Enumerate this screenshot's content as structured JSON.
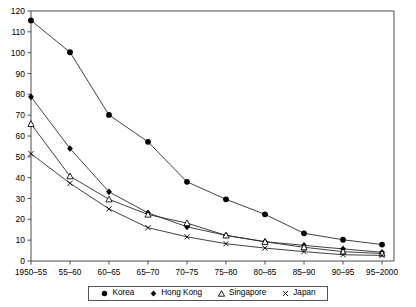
{
  "title_partial": "",
  "chart_data": {
    "type": "line",
    "title": "",
    "xlabel": "",
    "ylabel": "",
    "ylim": [
      0,
      120
    ],
    "ytick_step": 10,
    "grid": false,
    "legend_position": "bottom",
    "yticks": [
      0,
      10,
      20,
      30,
      40,
      50,
      60,
      70,
      80,
      90,
      100,
      110,
      120
    ],
    "categories": [
      "1950–55",
      "55–60",
      "60–65",
      "65–70",
      "70–75",
      "75–80",
      "80–85",
      "85–90",
      "90–95",
      "95–2000"
    ],
    "series": [
      {
        "name": "Korea",
        "marker": "filled-circle",
        "color": "#000000",
        "values": [
          115.5,
          100.2,
          70.1,
          57.2,
          38.0,
          29.6,
          22.4,
          13.3,
          10.2,
          7.9
        ]
      },
      {
        "name": "Hong Kong",
        "marker": "filled-diamond",
        "color": "#000000",
        "values": [
          78.8,
          54.0,
          33.2,
          23.1,
          16.4,
          12.3,
          9.3,
          7.5,
          5.8,
          4.2
        ]
      },
      {
        "name": "Singapore",
        "marker": "open-triangle",
        "color": "#000000",
        "values": [
          65.8,
          40.7,
          29.6,
          22.3,
          18.2,
          12.3,
          9.2,
          6.6,
          4.5,
          3.6
        ]
      },
      {
        "name": "Japan",
        "marker": "cross-x",
        "color": "#000000",
        "values": [
          51.5,
          37.3,
          25.0,
          16.0,
          11.6,
          8.3,
          6.2,
          4.5,
          3.0,
          2.7
        ]
      }
    ]
  },
  "legend": {
    "items": [
      {
        "label": "Korea",
        "marker": "filled-circle"
      },
      {
        "label": "Hong Kong",
        "marker": "filled-diamond"
      },
      {
        "label": "Singapore",
        "marker": "open-triangle"
      },
      {
        "label": "Japan",
        "marker": "cross-x"
      }
    ]
  }
}
